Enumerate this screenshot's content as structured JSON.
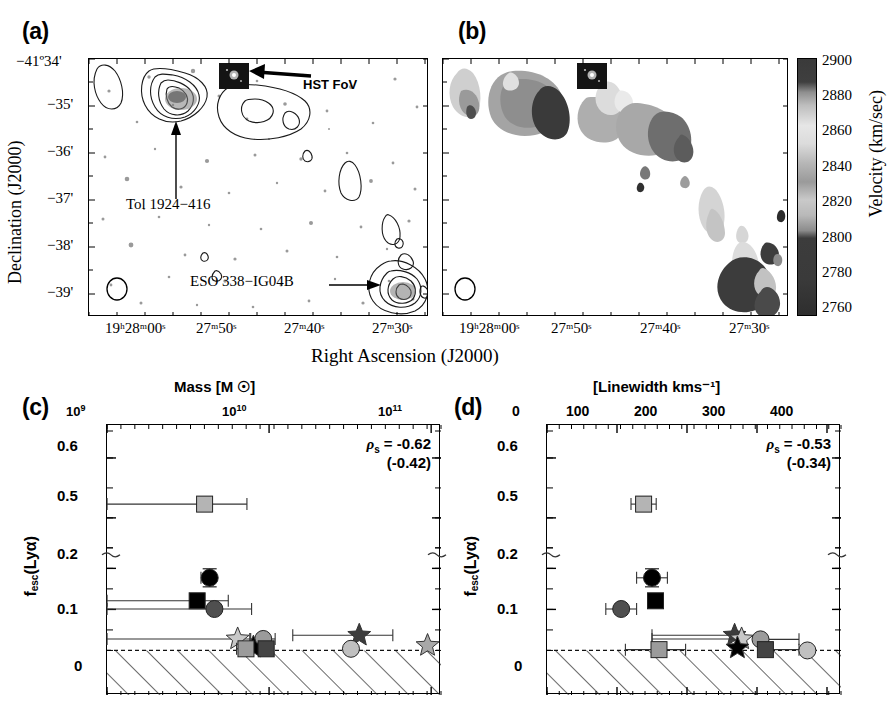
{
  "figure": {
    "panels": [
      {
        "id": "a",
        "letter": "(a)"
      },
      {
        "id": "b",
        "letter": "(b)"
      },
      {
        "id": "c",
        "letter": "(c)"
      },
      {
        "id": "d",
        "letter": "(d)"
      }
    ]
  },
  "sky": {
    "ylabel": "Declination (J2000)",
    "xlabel": "Right Ascension (J2000)",
    "dec_ticks": [
      "−41º34'",
      "−35'",
      "−36'",
      "−37'",
      "−38'",
      "−39'"
    ],
    "ra_ticks": [
      "19ʰ28ᵐ00ˢ",
      "27ᵐ50ˢ",
      "27ᵐ40ˢ",
      "27ᵐ30ˢ"
    ],
    "annotations": {
      "hst_fov": "HST FoV",
      "tol": "Tol 1924−416",
      "eso": "ESO 338−IG04B"
    }
  },
  "colorbar": {
    "label": "Velocity (km/sec)",
    "ticks": [
      "2900",
      "2880",
      "2860",
      "2840",
      "2820",
      "2800",
      "2780",
      "2760"
    ],
    "vmin": 2760,
    "vmax": 2900,
    "unit": "km/sec"
  },
  "chart_data": [
    {
      "panel": "c",
      "type": "scatter",
      "title": "Mass [M ☉]",
      "xlabel": "Mass [M ☉]",
      "ylabel": "f_esc(Lyα)",
      "ylabel_parts": {
        "base": "f",
        "sub": "esc",
        "rest": "(Lyα)"
      },
      "xscale": "log",
      "xlim": [
        1000000000.0,
        115000000000.0
      ],
      "xticks": [
        1000000000.0,
        10000000000.0,
        100000000000.0
      ],
      "xticklabels": [
        "10⁹",
        "10¹⁰",
        "10¹¹"
      ],
      "xtick_sup": [
        "9",
        "10",
        "11"
      ],
      "axis_position": "top",
      "yticks": [
        0,
        0.1,
        0.2,
        0.5,
        0.6
      ],
      "yticklabels": [
        "0",
        "0.1",
        "0.2",
        "0.5",
        "0.6"
      ],
      "y_broken": true,
      "y_break_between": [
        0.25,
        0.45
      ],
      "grid": false,
      "hatched_region": "below y = 0 (non-physical / upper-limit zone)",
      "annotation": {
        "rho_label": "ρ",
        "rho_sub": "s",
        "eq": " = -0.62",
        "paren": "(-0.42)"
      },
      "spearman_rho": -0.62,
      "spearman_rho_alt": -0.42,
      "points": [
        {
          "marker": "square",
          "fill": "#b4b4b4",
          "x": 4000000000.0,
          "y": 0.523,
          "xerr_lo": 3100000000.0,
          "xerr_hi": 3300000000.0,
          "yerr": 0.012
        },
        {
          "marker": "circle",
          "fill": "#000000",
          "x": 4300000000.0,
          "y": 0.177,
          "xerr_lo": 500000000.0,
          "xerr_hi": 0.0,
          "yerr": 0.022
        },
        {
          "marker": "square",
          "fill": "#000000",
          "x": 3600000000.0,
          "y": 0.121,
          "xerr_lo": 2600000000.0,
          "xerr_hi": 2000000000.0,
          "yerr": 0.0
        },
        {
          "marker": "circle",
          "fill": "#4f4f4f",
          "x": 4600000000.0,
          "y": 0.101,
          "xerr_lo": 3600000000.0,
          "xerr_hi": 3200000000.0,
          "yerr": 0.0
        },
        {
          "marker": "star",
          "fill": "#c8c8c8",
          "x": 6400000000.0,
          "y": 0.028,
          "xerr_lo": 5500000000.0,
          "xerr_hi": 1200000000.0,
          "yerr": 0.0
        },
        {
          "marker": "circle",
          "fill": "#9b9b9b",
          "x": 9200000000.0,
          "y": 0.028,
          "xerr_lo": 1500000000.0,
          "xerr_hi": 1700000000.0,
          "yerr": 0.0
        },
        {
          "marker": "star",
          "fill": "#000000",
          "x": 8000000000.0,
          "y": 0.008,
          "xerr_lo": 1400000000.0,
          "xerr_hi": 1000000000.0,
          "yerr": 0.0
        },
        {
          "marker": "square",
          "fill": "#9b9b9b",
          "x": 7200000000.0,
          "y": 0.004,
          "xerr_lo": 900000000.0,
          "xerr_hi": 600000000.0,
          "yerr": 0.0
        },
        {
          "marker": "square",
          "fill": "#444444",
          "x": 9600000000.0,
          "y": 0.004,
          "xerr_lo": 1000000000.0,
          "xerr_hi": 1000000000.0,
          "yerr": 0.0
        },
        {
          "marker": "star",
          "fill": "#3c3c3c",
          "x": 36000000000.0,
          "y": 0.037,
          "xerr_lo": 22000000000.0,
          "xerr_hi": 22000000000.0,
          "yerr": 0.0
        },
        {
          "marker": "circle",
          "fill": "#c0c0c0",
          "x": 32000000000.0,
          "y": 0.004,
          "xerr_lo": 0.0,
          "xerr_hi": 0.0,
          "yerr": 0.0
        },
        {
          "marker": "star",
          "fill": "#a8a8a8",
          "x": 95000000000.0,
          "y": 0.012,
          "xerr_lo": 0.0,
          "xerr_hi": 0.0,
          "yerr": 0.0
        }
      ]
    },
    {
      "panel": "d",
      "type": "scatter",
      "title": "[Linewidth kms⁻¹]",
      "xlabel": "[Linewidth kms⁻¹]",
      "ylabel": "f_esc(Lyα)",
      "ylabel_parts": {
        "base": "f",
        "sub": "esc",
        "rest": "(Lyα)"
      },
      "xscale": "linear",
      "xlim": [
        0,
        420
      ],
      "xticks": [
        0,
        100,
        200,
        300,
        400
      ],
      "xticklabels": [
        "0",
        "100",
        "200",
        "300",
        "400"
      ],
      "axis_position": "top",
      "yticks": [
        0,
        0.1,
        0.2,
        0.5,
        0.6
      ],
      "yticklabels": [
        "0",
        "0.1",
        "0.2",
        "0.5",
        "0.6"
      ],
      "y_broken": true,
      "y_break_between": [
        0.25,
        0.45
      ],
      "grid": false,
      "hatched_region": "below y = 0 (non-physical / upper-limit zone)",
      "annotation": {
        "rho_label": "ρ",
        "rho_sub": "s",
        "eq": " = -0.53",
        "paren": "(-0.34)"
      },
      "spearman_rho": -0.53,
      "spearman_rho_alt": -0.34,
      "points": [
        {
          "marker": "square",
          "fill": "#b4b4b4",
          "x": 138,
          "y": 0.523,
          "xerr_lo": 18,
          "xerr_hi": 18,
          "yerr": 0.012
        },
        {
          "marker": "circle",
          "fill": "#000000",
          "x": 150,
          "y": 0.177,
          "xerr_lo": 22,
          "xerr_hi": 22,
          "yerr": 0.022
        },
        {
          "marker": "square",
          "fill": "#000000",
          "x": 155,
          "y": 0.121,
          "xerr_lo": 0,
          "xerr_hi": 0,
          "yerr": 0.0
        },
        {
          "marker": "circle",
          "fill": "#4f4f4f",
          "x": 106,
          "y": 0.101,
          "xerr_lo": 22,
          "xerr_hi": 22,
          "yerr": 0.0
        },
        {
          "marker": "star",
          "fill": "#3c3c3c",
          "x": 268,
          "y": 0.037,
          "xerr_lo": 118,
          "xerr_hi": 0,
          "yerr": 0.0
        },
        {
          "marker": "star",
          "fill": "#c8c8c8",
          "x": 278,
          "y": 0.028,
          "xerr_lo": 128,
          "xerr_hi": 0,
          "yerr": 0.0
        },
        {
          "marker": "circle",
          "fill": "#9b9b9b",
          "x": 305,
          "y": 0.027,
          "xerr_lo": 0,
          "xerr_hi": 55,
          "yerr": 0.0
        },
        {
          "marker": "star",
          "fill": "#000000",
          "x": 272,
          "y": 0.006,
          "xerr_lo": 0,
          "xerr_hi": 0,
          "yerr": 0.0
        },
        {
          "marker": "square",
          "fill": "#9b9b9b",
          "x": 160,
          "y": 0.002,
          "xerr_lo": 48,
          "xerr_hi": 38,
          "yerr": 0.0
        },
        {
          "marker": "square",
          "fill": "#444444",
          "x": 312,
          "y": 0.002,
          "xerr_lo": 0,
          "xerr_hi": 48,
          "yerr": 0.0
        },
        {
          "marker": "circle",
          "fill": "#c0c0c0",
          "x": 372,
          "y": 0.0,
          "xerr_lo": 0,
          "xerr_hi": 0,
          "yerr": 0.0
        }
      ]
    }
  ]
}
